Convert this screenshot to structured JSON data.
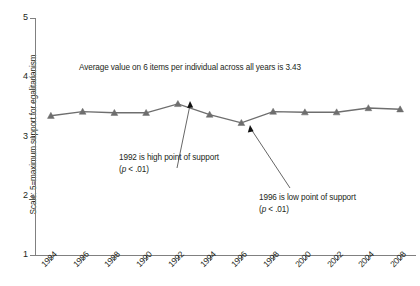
{
  "chart_data": {
    "type": "line",
    "title": "",
    "xlabel": "",
    "ylabel": "Scale: 5=maximum support for egalitarianism",
    "categories": [
      "1984",
      "1986",
      "1988",
      "1990",
      "1992",
      "1994",
      "1996",
      "1998",
      "2000",
      "2002",
      "2004",
      "2008"
    ],
    "values": [
      3.35,
      3.42,
      3.4,
      3.4,
      3.55,
      3.37,
      3.23,
      3.42,
      3.41,
      3.41,
      3.48,
      3.46
    ],
    "series": [
      {
        "name": "Support for egalitarianism",
        "values": [
          3.35,
          3.42,
          3.4,
          3.4,
          3.55,
          3.37,
          3.23,
          3.42,
          3.41,
          3.41,
          3.48,
          3.46
        ]
      }
    ],
    "ylim": [
      1,
      5
    ],
    "yticks": [
      "1",
      "2",
      "3",
      "4",
      "5"
    ],
    "grid": false,
    "legend": "none",
    "marker": "triangle",
    "line_color": "#6e6e6e",
    "marker_color": "#6e6e6e",
    "axis_color": "#808080",
    "annotations": [
      {
        "id": "average",
        "text": "Average value on 6 items per individual across all years is 3.43"
      },
      {
        "id": "high",
        "text": "1992 is high point of support",
        "sub_pre": "(",
        "sub_italic": "p",
        "sub_post": " < .01)",
        "points_to": "1992"
      },
      {
        "id": "low",
        "text": "1996 is low point of support",
        "sub_pre": "(",
        "sub_italic": "p",
        "sub_post": " < .01)",
        "points_to": "1996"
      }
    ]
  },
  "caption": ""
}
